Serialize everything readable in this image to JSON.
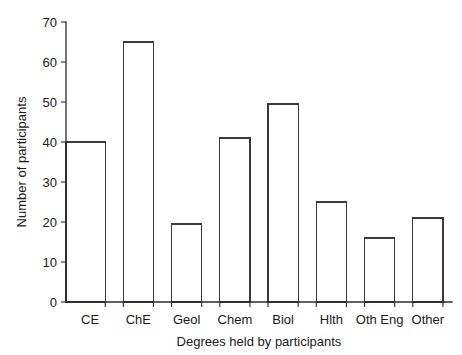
{
  "chart_data": {
    "type": "bar",
    "title": "",
    "subtitle": "",
    "xlabel": "Degrees held by participants",
    "ylabel": "Number of participants",
    "categories": [
      "CE",
      "ChE",
      "Geol",
      "Chem",
      "Biol",
      "Hlth",
      "Oth Eng",
      "Other"
    ],
    "values": [
      40,
      65,
      19.5,
      41,
      49.5,
      25,
      16,
      21
    ],
    "ylim": [
      0,
      70
    ],
    "yticks": [
      0,
      10,
      20,
      30,
      40,
      50,
      60,
      70
    ],
    "ytick_labels": [
      "0",
      "10",
      "20",
      "30",
      "40",
      "50",
      "60",
      "70"
    ],
    "grid": false,
    "legend": null,
    "bar_fill": "#ffffff",
    "bar_stroke": "#3a3a3a",
    "axis_color": "#2b2b2b",
    "background": "#ffffff"
  }
}
